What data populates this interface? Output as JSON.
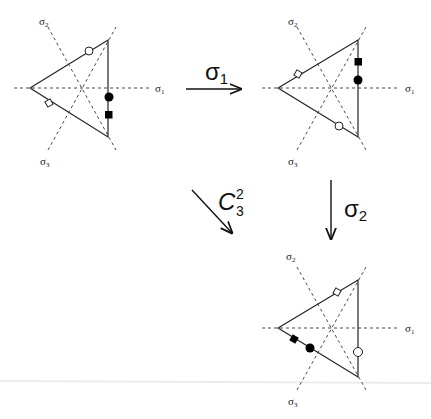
{
  "axis_labels": {
    "s1": "σ",
    "s1_sub": "1",
    "s2": "σ",
    "s2_sub": "2",
    "s3": "σ",
    "s3_sub": "3"
  },
  "transforms": {
    "sigma1": {
      "symbol": "σ",
      "sub": "1"
    },
    "sigma2": {
      "symbol": "σ",
      "sub": "2"
    },
    "c3sq": {
      "symbol": "C",
      "sup": "2",
      "sub": "3"
    }
  },
  "diagrams": [
    {
      "id": "original",
      "markers": [
        "open-circle on upper edge",
        "open-diamond on lower edge",
        "filled-circle on right edge",
        "filled-square on right edge"
      ]
    },
    {
      "id": "after-sigma1",
      "markers": [
        "open-diamond on upper edge",
        "open-circle on lower edge",
        "filled-square on right edge",
        "filled-circle on right edge"
      ]
    },
    {
      "id": "after-sigma2",
      "markers": [
        "open-diamond on upper edge",
        "filled-square on lower edge",
        "filled-circle on lower edge",
        "open-circle on right edge"
      ]
    }
  ]
}
